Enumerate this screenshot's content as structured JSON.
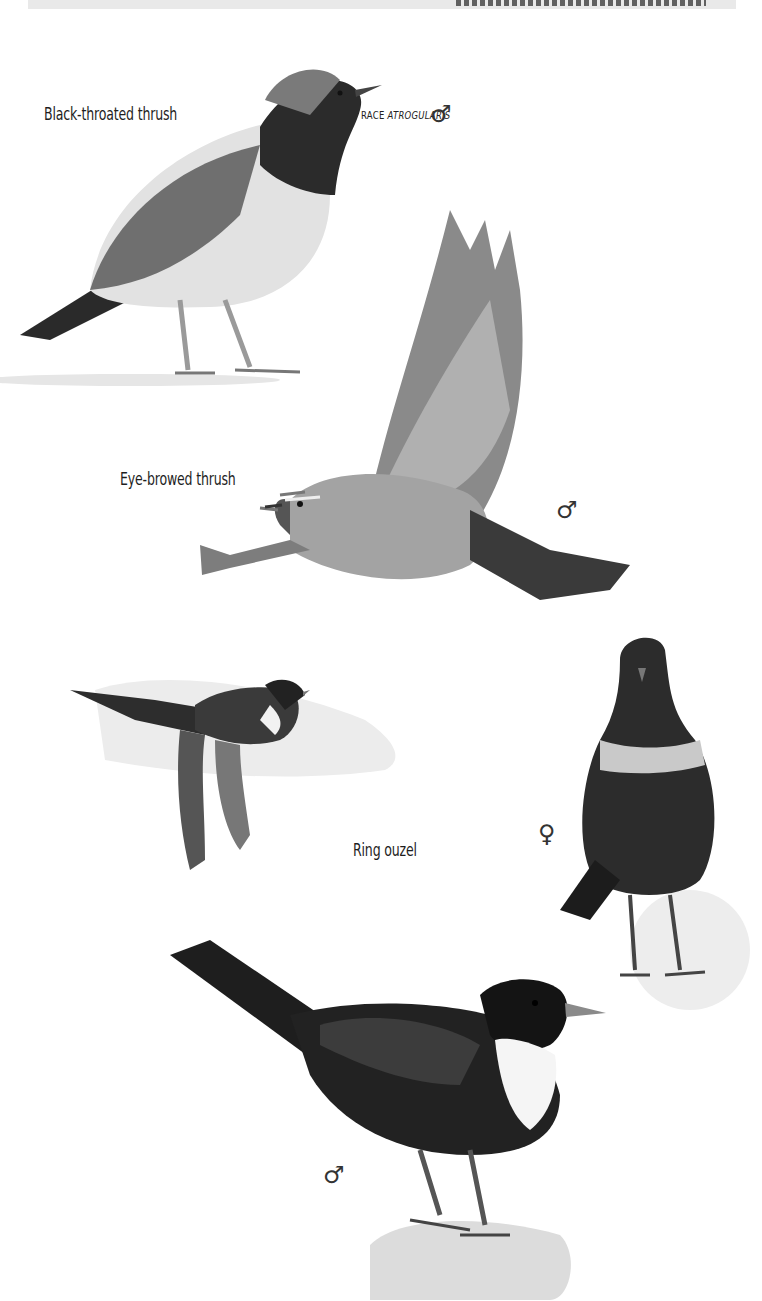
{
  "page": {
    "header": {
      "note": "Running head is clipped by the top edge of the image; text not legible"
    }
  },
  "plate": {
    "species": [
      {
        "name": "Black-throated thrush",
        "race_prefix": "RACE",
        "race_name": "ATROGULARIS",
        "figures": [
          {
            "sex_symbol": "♂",
            "pose": "standing"
          }
        ]
      },
      {
        "name": "Eye-browed thrush",
        "figures": [
          {
            "sex_symbol": "♂",
            "pose": "flying"
          }
        ]
      },
      {
        "name": "Ring ouzel",
        "figures": [
          {
            "sex_symbol": "",
            "pose": "flying"
          },
          {
            "sex_symbol": "♀",
            "pose": "standing-front"
          },
          {
            "sex_symbol": "♂",
            "pose": "perched-on-rock"
          }
        ]
      }
    ]
  },
  "colors": {
    "plumage_dark": "#1a1a1a",
    "plumage_grey": "#6b6b6b",
    "breast_light": "#d9d9d9",
    "background": "#ffffff"
  }
}
